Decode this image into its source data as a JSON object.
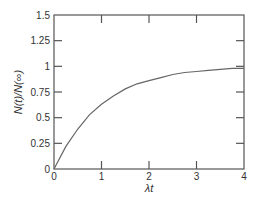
{
  "chart_data": {
    "type": "line",
    "title": "",
    "xlabel": "λt",
    "ylabel": "N(t)/N(∞)",
    "xlim": [
      0,
      4
    ],
    "ylim": [
      0,
      1.5
    ],
    "x_ticks": [
      0,
      1,
      2,
      3,
      4
    ],
    "x_tick_labels": [
      "0",
      "1",
      "2",
      "3",
      "4"
    ],
    "y_ticks": [
      0,
      0.25,
      0.5,
      0.75,
      1,
      1.25,
      1.5
    ],
    "y_tick_labels": [
      "0",
      "0.25",
      "0.5",
      "0.75",
      "1",
      "1.25",
      "1.5"
    ],
    "grid": false,
    "legend": null,
    "series": [
      {
        "name": "N(t)/N(∞)",
        "color": "#666666",
        "x": [
          0,
          0.25,
          0.5,
          0.75,
          1,
          1.25,
          1.5,
          1.75,
          2,
          2.25,
          2.5,
          2.75,
          3,
          3.25,
          3.5,
          3.75,
          4
        ],
        "y": [
          0,
          0.22,
          0.39,
          0.53,
          0.63,
          0.71,
          0.78,
          0.83,
          0.86,
          0.89,
          0.92,
          0.94,
          0.95,
          0.96,
          0.97,
          0.98,
          0.98
        ]
      }
    ]
  }
}
